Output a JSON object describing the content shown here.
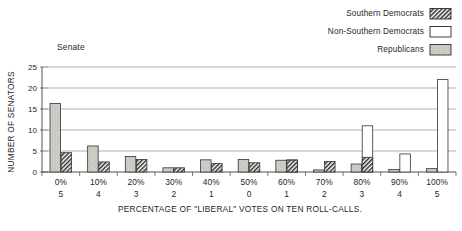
{
  "panel": {
    "label": "Senate"
  },
  "legend": {
    "position": "top-right",
    "items": [
      {
        "label": "Southern Democrats",
        "key": "southern_democrats",
        "fill": "hatch",
        "color": "#2b2b2b"
      },
      {
        "label": "Non-Southern Democrats",
        "key": "non_southern_democrats",
        "fill": "white",
        "color": "#ffffff"
      },
      {
        "label": "Republicans",
        "key": "republicans",
        "fill": "stipple",
        "color": "#cfcfcb"
      }
    ]
  },
  "axes": {
    "ylabel": "NUMBER OF SENATORS",
    "xlabel": "PERCENTAGE OF \"LIBERAL\" VOTES ON TEN ROLL-CALLS.",
    "yticks": [
      "0",
      "5",
      "10",
      "15",
      "20",
      "25"
    ],
    "ylim": [
      0,
      25
    ],
    "grid": true
  },
  "chart_data": {
    "type": "bar",
    "title": "Senate",
    "xlabel": "PERCENTAGE OF \"LIBERAL\" VOTES ON TEN ROLL-CALLS.",
    "ylabel": "NUMBER OF SENATORS",
    "ylim": [
      0,
      25
    ],
    "yticks": [
      0,
      5,
      10,
      15,
      20,
      25
    ],
    "grid": true,
    "categories": [
      "0%",
      "10%",
      "20%",
      "30%",
      "40%",
      "50%",
      "60%",
      "70%",
      "80%",
      "90%",
      "100%"
    ],
    "subcategories": [
      "5",
      "4",
      "3",
      "2",
      "1",
      "0",
      "1",
      "2",
      "3",
      "4",
      "5"
    ],
    "series": [
      {
        "name": "Southern Democrats",
        "fill": "hatch",
        "values": [
          4.6,
          2.4,
          3.0,
          1.0,
          2.0,
          2.2,
          2.8,
          2.5,
          3.5,
          null,
          null
        ]
      },
      {
        "name": "Non-Southern Democrats",
        "fill": "white",
        "values": [
          null,
          null,
          null,
          null,
          null,
          null,
          2.9,
          null,
          11.0,
          4.3,
          22.0
        ]
      },
      {
        "name": "Republicans",
        "fill": "stipple",
        "values": [
          16.3,
          6.2,
          3.7,
          1.0,
          2.9,
          3.0,
          2.8,
          0.5,
          1.9,
          0.6,
          0.8
        ]
      }
    ]
  }
}
